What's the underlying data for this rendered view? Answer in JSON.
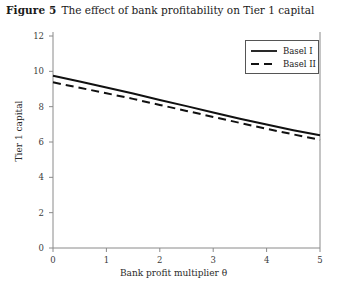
{
  "figure": {
    "label": "Figure 5",
    "title": "The effect of bank profitability on Tier 1 capital"
  },
  "chart_data": {
    "type": "line",
    "title": "The effect of bank profitability on Tier 1 capital",
    "xlabel": "Bank profit multiplier θ",
    "ylabel": "Tier 1 capital",
    "xlim": [
      0,
      5
    ],
    "ylim": [
      0,
      12
    ],
    "xticks": [
      "0",
      "1",
      "2",
      "3",
      "4",
      "5"
    ],
    "yticks": [
      "0",
      "2",
      "4",
      "6",
      "8",
      "10",
      "12"
    ],
    "grid": false,
    "legend_position": "top-right",
    "x": [
      0,
      0.5,
      1,
      1.5,
      2,
      2.5,
      3,
      3.5,
      4,
      4.5,
      5
    ],
    "series": [
      {
        "name": "Basel I",
        "style": "solid",
        "color": "#111111",
        "values": [
          9.75,
          9.42,
          9.08,
          8.74,
          8.38,
          8.03,
          7.67,
          7.32,
          6.99,
          6.67,
          6.38
        ]
      },
      {
        "name": "Basel II",
        "style": "dashed",
        "color": "#111111",
        "values": [
          9.38,
          9.07,
          8.76,
          8.44,
          8.1,
          7.76,
          7.42,
          7.08,
          6.75,
          6.43,
          6.12
        ]
      }
    ]
  },
  "legend": {
    "items": [
      {
        "label": "Basel I",
        "style": "solid"
      },
      {
        "label": "Basel II",
        "style": "dashed"
      }
    ]
  },
  "axes": {
    "y_ticks": [
      {
        "value": 12,
        "label": "12"
      },
      {
        "value": 10,
        "label": "10"
      },
      {
        "value": 8,
        "label": "8"
      },
      {
        "value": 6,
        "label": "6"
      },
      {
        "value": 4,
        "label": "4"
      },
      {
        "value": 2,
        "label": "2"
      },
      {
        "value": 0,
        "label": "0"
      }
    ],
    "x_ticks": [
      {
        "value": 0,
        "label": "0"
      },
      {
        "value": 1,
        "label": "1"
      },
      {
        "value": 2,
        "label": "2"
      },
      {
        "value": 3,
        "label": "3"
      },
      {
        "value": 4,
        "label": "4"
      },
      {
        "value": 5,
        "label": "5"
      }
    ],
    "x_title": "Bank profit multiplier θ",
    "y_title": "Tier 1 capital"
  },
  "colors": {
    "background": "#ffffff",
    "axis": "#8a8a8a",
    "text": "#231f20",
    "line": "#111111"
  }
}
